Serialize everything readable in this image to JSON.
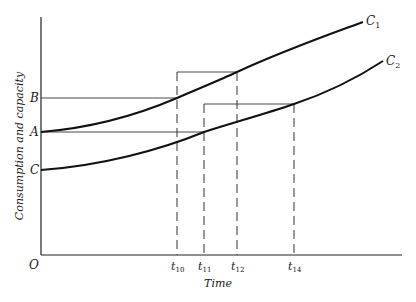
{
  "diagram": {
    "y_axis_label": "Consumption and capacity",
    "x_axis_label": "Time",
    "origin_label": "O",
    "y_labels": {
      "B": "B",
      "A": "A",
      "C": "C"
    },
    "curves": [
      {
        "name": "C1",
        "label_main": "C",
        "label_sub": "1"
      },
      {
        "name": "C2",
        "label_main": "C",
        "label_sub": "2"
      }
    ],
    "x_ticks": [
      {
        "main": "t",
        "sub": "10"
      },
      {
        "main": "t",
        "sub": "11"
      },
      {
        "main": "t",
        "sub": "12"
      },
      {
        "main": "t",
        "sub": "14"
      }
    ]
  }
}
